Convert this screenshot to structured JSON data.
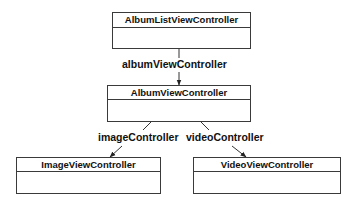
{
  "diagram": {
    "type": "class-relationship",
    "nodes": [
      {
        "id": "album_list",
        "name": "AlbumListViewController"
      },
      {
        "id": "album",
        "name": "AlbumViewController"
      },
      {
        "id": "image",
        "name": "ImageViewController"
      },
      {
        "id": "video",
        "name": "VideoViewController"
      }
    ],
    "edges": [
      {
        "from": "album_list",
        "to": "album",
        "label": "albumViewController"
      },
      {
        "from": "album",
        "to": "image",
        "label": "imageController"
      },
      {
        "from": "album",
        "to": "video",
        "label": "videoController"
      }
    ],
    "colors": {
      "line": "#3a3a3a",
      "text": "#111111",
      "background": "#ffffff"
    }
  }
}
